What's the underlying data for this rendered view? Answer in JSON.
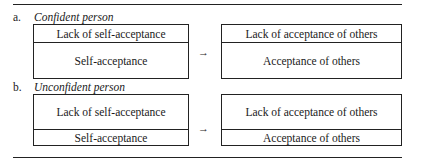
{
  "sections": [
    {
      "letter": "a.",
      "title": "Confident person",
      "left_box": {
        "top": "Lack of self-acceptance",
        "bottom": "Self-acceptance"
      },
      "arrow": "→",
      "right_box": {
        "top": "Lack of acceptance of others",
        "bottom": "Acceptance of others"
      }
    },
    {
      "letter": "b.",
      "title": "Unconfident person",
      "left_box": {
        "top": "Lack of self-acceptance",
        "bottom": "Self-acceptance"
      },
      "arrow": "→",
      "right_box": {
        "top": "Lack of acceptance of others",
        "bottom": "Acceptance of others"
      }
    }
  ]
}
